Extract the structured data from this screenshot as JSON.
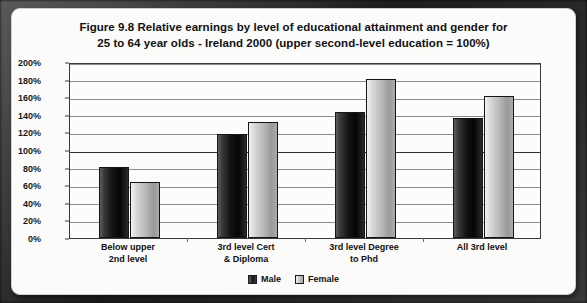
{
  "figure": {
    "title_line1": "Figure 9.8   Relative earnings by level of educational attainment and gender for",
    "title_line2": "25 to 64 year olds - Ireland 2000 (upper second-level education = 100%)"
  },
  "legend": {
    "position": "bottom-center",
    "entries": [
      {
        "label": "Male",
        "swatch": "male-swatch",
        "color": "#151515"
      },
      {
        "label": "Female",
        "swatch": "female-swatch",
        "color": "#bdbdbd"
      }
    ]
  },
  "axes": {
    "y_ticks": [
      "0%",
      "20%",
      "40%",
      "60%",
      "80%",
      "100%",
      "120%",
      "140%",
      "160%",
      "180%",
      "200%"
    ],
    "x_ticks": [
      {
        "line1": "Below upper",
        "line2": "2nd level"
      },
      {
        "line1": "3rd level Cert",
        "line2": "& Diploma"
      },
      {
        "line1": "3rd level Degree",
        "line2": "to Phd"
      },
      {
        "line1": "All 3rd level",
        "line2": ""
      }
    ]
  },
  "chart_data": {
    "type": "bar",
    "title": "Figure 9.8   Relative earnings by level of educational attainment and gender for 25 to 64 year olds - Ireland 2000 (upper second-level education = 100%)",
    "xlabel": "",
    "ylabel": "",
    "ylim": [
      0,
      200
    ],
    "ytick_step": 20,
    "ytick_format": "percent",
    "grid": true,
    "reference_line": 100,
    "legend_position": "bottom-center",
    "categories": [
      "Below upper 2nd level",
      "3rd level Cert & Diploma",
      "3rd level Degree to Phd",
      "All 3rd level"
    ],
    "series": [
      {
        "name": "Male",
        "color": "#151515",
        "values": [
          81,
          118,
          143,
          136
        ]
      },
      {
        "name": "Female",
        "color": "#bdbdbd",
        "values": [
          64,
          132,
          181,
          161
        ]
      }
    ]
  }
}
